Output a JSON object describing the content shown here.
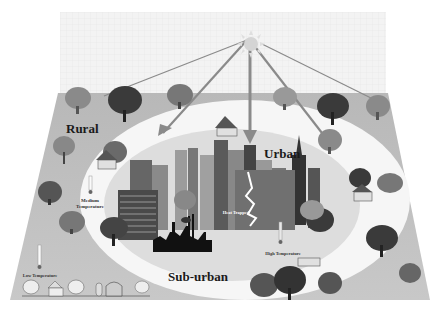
{
  "diagram": {
    "zones": [
      {
        "id": "rural",
        "label": "Rural"
      },
      {
        "id": "suburban",
        "label": "Sub-urban"
      },
      {
        "id": "urban",
        "label": "Urban"
      }
    ],
    "annotations": {
      "low_temp": "Low Temperature",
      "medium_temp": "Medium Temperature",
      "medium_temp_line1": "Medium",
      "medium_temp_line2": "Temperature",
      "high_temp": "High Temperature",
      "heat_trapped": "Heat Trapped"
    },
    "icons": [
      "sun-icon",
      "tree-icon",
      "house-icon",
      "barn-icon",
      "skyscraper-icon",
      "factory-icon",
      "thermometer-icon",
      "lightning-arrow-icon"
    ],
    "colors": {
      "sky": "#f2f2f2",
      "ground": "#bdbdbd",
      "suburban_ring": "#f7f7f7",
      "urban_core": "#dcdcdc",
      "sun": "#d0d0d0",
      "ray": "#8a8a8a",
      "text": "#1a1a1a"
    }
  }
}
